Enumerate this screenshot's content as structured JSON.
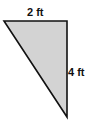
{
  "diagram": {
    "shape": "right-triangle",
    "fill_color": "#d3d3d3",
    "stroke_color": "#111111",
    "vertices": [
      [
        4,
        21
      ],
      [
        67,
        21
      ],
      [
        67,
        117
      ]
    ],
    "labels": {
      "top_side": "2 ft",
      "right_side": "4 ft"
    }
  }
}
